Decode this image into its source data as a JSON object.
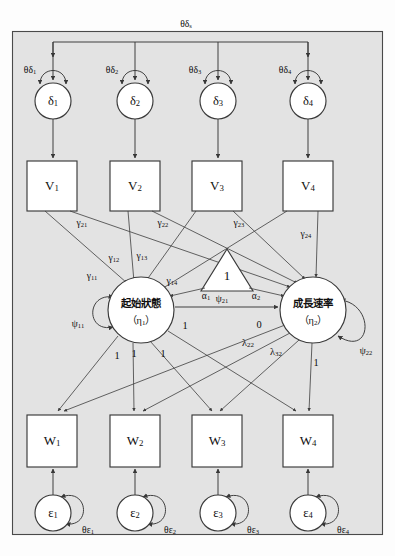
{
  "figure": {
    "kind": "structural-equation-model-path-diagram",
    "background_color": "#e3e3e3",
    "frame_border_color": "#4a4a4a",
    "node_fill": "#ffffff",
    "node_stroke": "#3a3a3a",
    "edge_color": "#383838"
  },
  "nodes": {
    "disturbances": [
      {
        "id": "delta1",
        "label": "δ",
        "subscript": "1",
        "shape": "circle",
        "cx": 53,
        "cy": 101,
        "r": 18
      },
      {
        "id": "delta2",
        "label": "δ",
        "subscript": "2",
        "shape": "circle",
        "cx": 135,
        "cy": 101,
        "r": 18
      },
      {
        "id": "delta3",
        "label": "δ",
        "subscript": "3",
        "shape": "circle",
        "cx": 218,
        "cy": 101,
        "r": 18
      },
      {
        "id": "delta4",
        "label": "δ",
        "subscript": "4",
        "shape": "circle",
        "cx": 308,
        "cy": 101,
        "r": 18
      }
    ],
    "predictors": [
      {
        "id": "V1",
        "label": "V",
        "subscript": "1",
        "shape": "rect",
        "x": 27,
        "y": 161,
        "w": 50,
        "h": 50
      },
      {
        "id": "V2",
        "label": "V",
        "subscript": "2",
        "shape": "rect",
        "x": 110,
        "y": 161,
        "w": 50,
        "h": 50
      },
      {
        "id": "V3",
        "label": "V",
        "subscript": "3",
        "shape": "rect",
        "x": 192,
        "y": 161,
        "w": 50,
        "h": 50
      },
      {
        "id": "V4",
        "label": "V",
        "subscript": "4",
        "shape": "rect",
        "x": 283,
        "y": 161,
        "w": 50,
        "h": 50
      }
    ],
    "latents": [
      {
        "id": "eta1",
        "label_cjk": "起始狀態",
        "label_greek": "（η",
        "label_greek_sub": "1",
        "label_greek_tail": "）",
        "shape": "circle",
        "cx": 141,
        "cy": 310,
        "r": 33
      },
      {
        "id": "eta2",
        "label_cjk": "成長速率",
        "label_greek": "（η",
        "label_greek_sub": "2",
        "label_greek_tail": "）",
        "shape": "circle",
        "cx": 313,
        "cy": 310,
        "r": 33
      }
    ],
    "constant": {
      "id": "constant-triangle",
      "label": "1",
      "shape": "triangle",
      "cx": 227,
      "cy_top": 249,
      "cy_base": 291,
      "half_width": 26
    },
    "indicators": [
      {
        "id": "W1",
        "label": "W",
        "subscript": "1",
        "shape": "rect",
        "x": 27,
        "y": 415,
        "w": 50,
        "h": 52
      },
      {
        "id": "W2",
        "label": "W",
        "subscript": "2",
        "shape": "rect",
        "x": 110,
        "y": 415,
        "w": 50,
        "h": 52
      },
      {
        "id": "W3",
        "label": "W",
        "subscript": "3",
        "shape": "rect",
        "x": 192,
        "y": 415,
        "w": 50,
        "h": 52
      },
      {
        "id": "W4",
        "label": "W",
        "subscript": "4",
        "shape": "rect",
        "x": 283,
        "y": 415,
        "w": 50,
        "h": 52
      }
    ],
    "errors": [
      {
        "id": "eps1",
        "label": "ε",
        "subscript": "1",
        "shape": "circle",
        "cx": 53,
        "cy": 513,
        "r": 18
      },
      {
        "id": "eps2",
        "label": "ε",
        "subscript": "2",
        "shape": "circle",
        "cx": 135,
        "cy": 513,
        "r": 18
      },
      {
        "id": "eps3",
        "label": "ε",
        "subscript": "3",
        "shape": "circle",
        "cx": 218,
        "cy": 513,
        "r": 18
      },
      {
        "id": "eps4",
        "label": "ε",
        "subscript": "4",
        "shape": "circle",
        "cx": 308,
        "cy": 513,
        "r": 18
      }
    ]
  },
  "parameters": {
    "delta_covariance_top": {
      "label": "θδ",
      "subscript": "s",
      "x": 186,
      "y": 25
    },
    "delta_variances": [
      {
        "label": "θδ",
        "subscript": "1",
        "x": 30,
        "y": 71
      },
      {
        "label": "θδ",
        "subscript": "2",
        "x": 112,
        "y": 71
      },
      {
        "label": "θδ",
        "subscript": "3",
        "x": 195,
        "y": 71
      },
      {
        "label": "θδ",
        "subscript": "4",
        "x": 285,
        "y": 71
      }
    ],
    "gammas_row1": [
      {
        "label": "γ",
        "subscript": "21",
        "x": 82,
        "y": 224
      },
      {
        "label": "γ",
        "subscript": "22",
        "x": 163,
        "y": 224
      },
      {
        "label": "γ",
        "subscript": "23",
        "x": 239,
        "y": 224
      },
      {
        "label": "γ",
        "subscript": "24",
        "x": 306,
        "y": 235
      }
    ],
    "gammas_row2": [
      {
        "label": "γ",
        "subscript": "11",
        "x": 92,
        "y": 277
      },
      {
        "label": "γ",
        "subscript": "12",
        "x": 114,
        "y": 259
      },
      {
        "label": "γ",
        "subscript": "13",
        "x": 142,
        "y": 257
      },
      {
        "label": "γ",
        "subscript": "14",
        "x": 172,
        "y": 282
      }
    ],
    "alphas": [
      {
        "label": "α",
        "subscript": "1",
        "x": 206,
        "y": 297
      },
      {
        "label": "α",
        "subscript": "2",
        "x": 256,
        "y": 297
      }
    ],
    "psis": [
      {
        "label": "ψ",
        "subscript": "11",
        "x": 78,
        "y": 325
      },
      {
        "label": "ψ",
        "subscript": "21",
        "x": 222,
        "y": 313
      },
      {
        "label": "ψ",
        "subscript": "22",
        "x": 364,
        "y": 350
      }
    ],
    "lambda_fixed_zero": {
      "label": "0",
      "x": 259,
      "y": 326
    },
    "lambda_free": [
      {
        "label": "λ",
        "subscript": "22",
        "x": 248,
        "y": 344
      },
      {
        "label": "λ",
        "subscript": "32",
        "x": 274,
        "y": 352
      }
    ],
    "unit_loadings": [
      {
        "label": "1",
        "x": 185,
        "y": 327
      },
      {
        "label": "1",
        "x": 115,
        "y": 357
      },
      {
        "label": "1",
        "x": 133,
        "y": 355
      },
      {
        "label": "1",
        "x": 163,
        "y": 355
      },
      {
        "label": "1",
        "x": 314,
        "y": 364
      }
    ],
    "error_variances": [
      {
        "label": "θε",
        "subscript": "1",
        "x": 86,
        "y": 530
      },
      {
        "label": "θε",
        "subscript": "2",
        "x": 168,
        "y": 530
      },
      {
        "label": "θε",
        "subscript": "3",
        "x": 251,
        "y": 530
      },
      {
        "label": "θε",
        "subscript": "4",
        "x": 341,
        "y": 530
      }
    ]
  },
  "edges": {
    "delta_to_V": [
      {
        "from": "delta1",
        "to": "V1",
        "x": 53,
        "y1": 119,
        "y2": 159
      },
      {
        "from": "delta2",
        "to": "V2",
        "x": 135,
        "y1": 119,
        "y2": 159
      },
      {
        "from": "delta3",
        "to": "V3",
        "x": 218,
        "y1": 119,
        "y2": 159
      },
      {
        "from": "delta4",
        "to": "V4",
        "x": 308,
        "y1": 119,
        "y2": 159
      }
    ],
    "W_from_eps": [
      {
        "from": "eps1",
        "to": "W1",
        "x": 53,
        "y1": 495,
        "y2": 470
      },
      {
        "from": "eps2",
        "to": "W2",
        "x": 135,
        "y1": 495,
        "y2": 470
      },
      {
        "from": "eps3",
        "to": "W3",
        "x": 218,
        "y1": 495,
        "y2": 470
      },
      {
        "from": "eps4",
        "to": "W4",
        "x": 308,
        "y1": 495,
        "y2": 470
      }
    ],
    "eta1_eta2_covariance": {
      "from": "eta1",
      "to": "eta2",
      "label_ref": "psis.1"
    },
    "V_to_eta1_paths": 4,
    "V_to_eta2_paths": 4,
    "eta1_to_W_loadings": [
      1,
      1,
      1,
      1
    ],
    "eta2_to_W_loadings": [
      "0",
      "λ22",
      "λ32",
      "1"
    ]
  }
}
